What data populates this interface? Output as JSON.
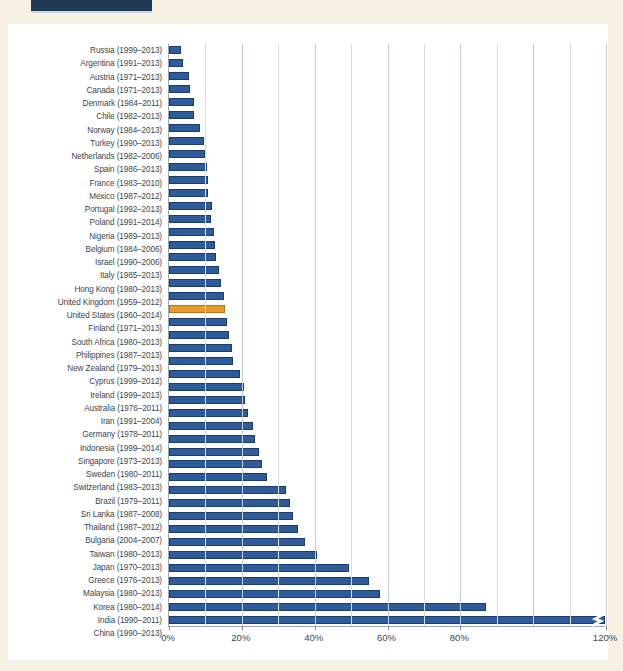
{
  "page": {
    "background_color": "#f6f1e2",
    "panel_color": "#ffffff",
    "header_tab_color": "#1f3a55"
  },
  "colors": {
    "bar": "#2e5c9a",
    "bar_border": "#1b3c6b",
    "highlight_bar": "#eb9a2c",
    "highlight_bar_border": "#b8701a",
    "gridline": "#d6dde4",
    "axis": "#9aa7b4",
    "label_text": "#3c4650"
  },
  "chart_data": {
    "type": "bar",
    "orientation": "horizontal",
    "title": "",
    "subtitle": "",
    "xlabel": "",
    "ylabel": "",
    "xlim": [
      0,
      120
    ],
    "grid": true,
    "grid_minor_step": 10,
    "legend": "none",
    "axis_break": {
      "present": true,
      "at_category": "China (1990–2013)",
      "note": "bar extends beyond axis; zigzag break mark drawn near right edge"
    },
    "tick_labels": [
      "0%",
      "20%",
      "40%",
      "60%",
      "80%",
      "120%"
    ],
    "tick_values": [
      0,
      20,
      40,
      60,
      80,
      120
    ],
    "highlight_category": "United States (1960–2014)",
    "categories": [
      "Russia  (1999–2013)",
      "Argentina (1991–2013)",
      "Austria (1971–2013)",
      "Canada  (1971–2013)",
      "Denmark (1984–2011)",
      "Chile (1982–2013)",
      "Norway (1984–2013)",
      "Turkey (1990–2013)",
      "Netherlands (1982–2006)",
      "Spain (1986–2013)",
      "France (1983–2010)",
      "Mexico (1987–2012)",
      "Portugal (1992–2013)",
      "Poland (1991–2014)",
      "Nigeria (1989–2013)",
      "Belgium (1984–2006)",
      "Israel (1990–2006)",
      "Italy (1985–2013)",
      "Hong Kong (1980–2013)",
      "United Kingdom (1959–2012)",
      "United States (1960–2014)",
      "Finland (1971–2013)",
      "South Africa (1980–2013)",
      "Philippines (1987–2013)",
      "New Zealand (1979–2013)",
      "Cyprus (1999–2012)",
      "Ireland (1999–2013)",
      "Australia (1976–2011)",
      "Iran (1991–2004)",
      "Germany (1978–2011)",
      "Indonesia (1999–2014)",
      "Singapore (1973–2013)",
      "Sweden (1980–2011)",
      "Switzerland (1983–2013)",
      "Brazil (1979–2011)",
      "Sri Lanka (1987–2008)",
      "Thailand (1987–2012)",
      "Bulgaria (2004–2007)",
      "Taiwan (1980–2013)",
      "Japan (1970–2013)",
      "Greece (1976–2013)",
      "Malaysia (1980–2013)",
      "Korea (1980–2014)",
      "India (1990–2011)",
      "China (1990–2013)"
    ],
    "values": [
      3.2,
      3.8,
      5.6,
      5.8,
      7.0,
      6.8,
      8.4,
      9.6,
      9.8,
      10.4,
      10.8,
      10.6,
      11.8,
      11.4,
      12.4,
      12.6,
      12.8,
      13.6,
      14.4,
      15.0,
      15.4,
      15.8,
      16.6,
      17.4,
      17.6,
      19.6,
      20.6,
      21.0,
      21.6,
      23.0,
      23.6,
      24.6,
      25.6,
      27.0,
      32.0,
      33.2,
      34.0,
      35.4,
      37.4,
      40.6,
      49.4,
      55.0,
      58.0,
      87.0,
      120.0
    ]
  }
}
